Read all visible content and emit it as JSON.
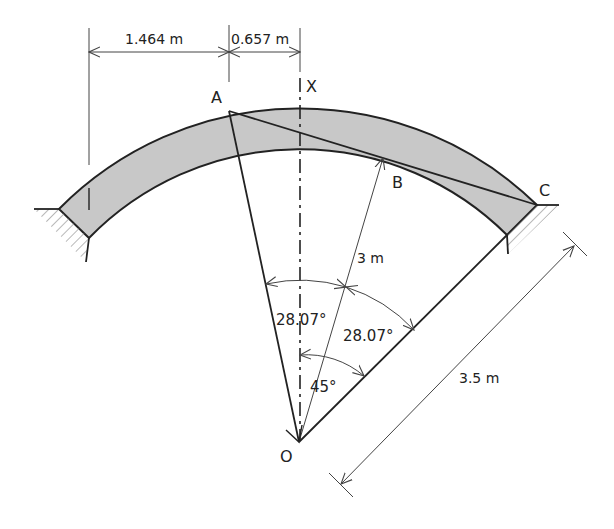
{
  "diagram": {
    "colors": {
      "line": "#222222",
      "thin_line": "#444444",
      "arch_fill": "#c8c8c8",
      "hatch": "#888888",
      "background": "#ffffff"
    },
    "points": {
      "A": "A",
      "B": "B",
      "C": "C",
      "O": "O",
      "X": "X"
    },
    "dimensions": {
      "horizontal_left": "1.464 m",
      "horizontal_right": "0.657 m",
      "radius_inner": "3 m",
      "radius_outer": "3.5 m"
    },
    "angles": {
      "angle_AOB": "28.07°",
      "angle_BOC": "28.07°",
      "angle_XOC": "45°"
    }
  }
}
